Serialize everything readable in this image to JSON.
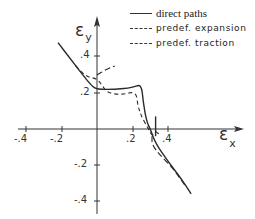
{
  "chart_data": {
    "type": "line",
    "title": "",
    "xlabel": "ε_x",
    "ylabel": "ε_y",
    "xlim": [
      -0.45,
      0.6
    ],
    "ylim": [
      -0.45,
      0.55
    ],
    "grid": false,
    "legend_position": "top-right",
    "x_ticks": [
      "-.4",
      "-.2",
      ".2",
      ".4"
    ],
    "y_ticks": [
      ".4",
      ".2",
      "-.2",
      "-.4"
    ],
    "series": [
      {
        "name": "direct paths",
        "style": "solid",
        "points": [
          [
            -0.22,
            0.48
          ],
          [
            -0.15,
            0.39
          ],
          [
            -0.08,
            0.3
          ],
          [
            -0.03,
            0.24
          ],
          [
            0.0,
            0.22
          ],
          [
            0.1,
            0.22
          ],
          [
            0.2,
            0.23
          ],
          [
            0.25,
            0.25
          ],
          [
            0.26,
            0.15
          ],
          [
            0.28,
            0.04
          ],
          [
            0.3,
            0.0
          ],
          [
            0.33,
            -0.08
          ],
          [
            0.4,
            -0.18
          ],
          [
            0.47,
            -0.27
          ],
          [
            0.53,
            -0.36
          ]
        ]
      },
      {
        "name": "predef. expansion",
        "style": "dashed",
        "points": [
          [
            -0.12,
            0.35
          ],
          [
            -0.06,
            0.29
          ],
          [
            0.0,
            0.28
          ],
          [
            0.03,
            0.24
          ],
          [
            0.06,
            0.2
          ],
          [
            0.14,
            0.19
          ],
          [
            0.22,
            0.21
          ],
          [
            0.23,
            0.13
          ],
          [
            0.25,
            0.07
          ],
          [
            0.29,
            0.0
          ],
          [
            0.31,
            -0.04
          ],
          [
            0.33,
            -0.01
          ],
          [
            0.35,
            -0.03
          ]
        ]
      },
      {
        "name": "predef. traction",
        "style": "long-dashed",
        "points": [
          [
            0.0,
            0.3
          ],
          [
            0.05,
            0.33
          ],
          [
            0.1,
            0.35
          ]
        ]
      },
      {
        "name": "predef. traction (lower branch)",
        "style": "long-dashed",
        "points": [
          [
            0.31,
            -0.04
          ],
          [
            0.31,
            -0.09
          ],
          [
            0.36,
            -0.15
          ],
          [
            0.43,
            -0.22
          ],
          [
            0.5,
            -0.32
          ]
        ]
      },
      {
        "name": "direct paths (tick stroke near .3)",
        "style": "solid",
        "points": [
          [
            0.33,
            0.07
          ],
          [
            0.33,
            -0.04
          ]
        ]
      }
    ]
  },
  "legend": {
    "items": [
      {
        "label": "direct paths",
        "style": "solid"
      },
      {
        "label": "predef. expansion",
        "style": "dashed"
      },
      {
        "label": "predef. traction",
        "style": "long-dashed"
      }
    ]
  },
  "axes": {
    "x_label_main": "ε",
    "x_label_sub": "x",
    "y_label_main": "ε",
    "y_label_sub": "y",
    "x_tick_labels": [
      "-.4",
      "-.2",
      ".2",
      ".4"
    ],
    "y_tick_labels": [
      ".4",
      ".2",
      "-.2",
      "-.4"
    ]
  },
  "colors": {
    "line": "#2a2a2a",
    "background": "#ffffff"
  }
}
